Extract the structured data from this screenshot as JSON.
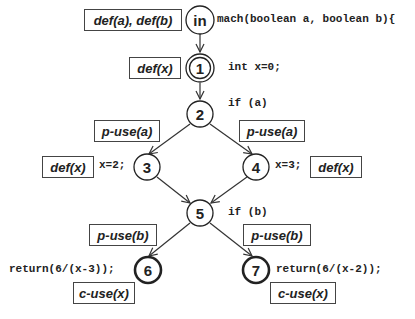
{
  "diagram": {
    "type": "control-flow-graph",
    "nodes": [
      {
        "id": "in",
        "label": "in",
        "style": "plain",
        "code": "mach(boolean a, boolean b){",
        "annotation": "def(a), def(b)"
      },
      {
        "id": "1",
        "label": "1",
        "style": "double",
        "code": "int x=0;",
        "annotation": "def(x)"
      },
      {
        "id": "2",
        "label": "2",
        "style": "plain",
        "code": "if (a)"
      },
      {
        "id": "3",
        "label": "3",
        "style": "plain",
        "code": "x=2;",
        "annotation": "def(x)"
      },
      {
        "id": "4",
        "label": "4",
        "style": "plain",
        "code": "x=3;",
        "annotation": "def(x)"
      },
      {
        "id": "5",
        "label": "5",
        "style": "plain",
        "code": "if (b)"
      },
      {
        "id": "6",
        "label": "6",
        "style": "bold",
        "code": "return(6/(x-3));",
        "annotation": "c-use(x)"
      },
      {
        "id": "7",
        "label": "7",
        "style": "bold",
        "code": "return(6/(x-2));",
        "annotation": "c-use(x)"
      }
    ],
    "edges": [
      {
        "from": "in",
        "to": "1"
      },
      {
        "from": "1",
        "to": "2"
      },
      {
        "from": "2",
        "to": "3",
        "annotation": "p-use(a)"
      },
      {
        "from": "2",
        "to": "4",
        "annotation": "p-use(a)"
      },
      {
        "from": "3",
        "to": "5"
      },
      {
        "from": "4",
        "to": "5"
      },
      {
        "from": "5",
        "to": "6",
        "annotation": "p-use(b)"
      },
      {
        "from": "5",
        "to": "7",
        "annotation": "p-use(b)"
      }
    ]
  }
}
